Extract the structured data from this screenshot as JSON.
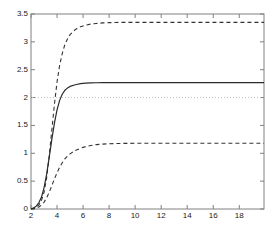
{
  "chart_data": {
    "type": "line",
    "title": "",
    "xlabel": "",
    "ylabel": "",
    "xlim": [
      2,
      19.9
    ],
    "ylim": [
      0,
      3.5
    ],
    "xticks": [
      2,
      4,
      6,
      8,
      10,
      12,
      14,
      16,
      18
    ],
    "xtick_labels": [
      "2",
      "4",
      "6",
      "8",
      "10",
      "12",
      "14",
      "16",
      "18"
    ],
    "yticks": [
      0,
      0.5,
      1,
      1.5,
      2,
      2.5,
      3,
      3.5
    ],
    "ytick_labels": [
      "0",
      "0.5",
      "1",
      "1.5",
      "2",
      "2.5",
      "3",
      "3.5"
    ],
    "grid": false,
    "legend": null,
    "background": "#ffffff",
    "axis_color": "#808080",
    "series": [
      {
        "name": "upper-confidence-bound",
        "style": "dashed",
        "color": "#333333",
        "asymptote": 3.35,
        "x": [
          2.0,
          2.2,
          2.4,
          2.6,
          2.8,
          3.0,
          3.2,
          3.4,
          3.6,
          3.8,
          4.0,
          4.2,
          4.4,
          4.6,
          4.8,
          5.0,
          5.4,
          5.8,
          6.2,
          6.6,
          7.0,
          7.5,
          8.0,
          8.5,
          9.0,
          9.5,
          10.0,
          11.0,
          12.0,
          13.0,
          14.0,
          15.0,
          16.0,
          17.0,
          18.0,
          19.0,
          19.9
        ],
        "values": [
          0.0,
          0.01,
          0.03,
          0.07,
          0.15,
          0.3,
          0.56,
          0.95,
          1.42,
          1.88,
          2.28,
          2.58,
          2.79,
          2.95,
          3.05,
          3.13,
          3.22,
          3.27,
          3.3,
          3.32,
          3.33,
          3.34,
          3.345,
          3.348,
          3.35,
          3.35,
          3.35,
          3.35,
          3.35,
          3.35,
          3.35,
          3.35,
          3.35,
          3.35,
          3.35,
          3.35,
          3.35
        ]
      },
      {
        "name": "mean-estimate",
        "style": "solid",
        "color": "#2b2b2b",
        "asymptote": 2.27,
        "x": [
          2.0,
          2.2,
          2.4,
          2.6,
          2.8,
          3.0,
          3.2,
          3.4,
          3.6,
          3.8,
          4.0,
          4.2,
          4.4,
          4.6,
          4.8,
          5.0,
          5.4,
          5.8,
          6.2,
          6.6,
          7.0,
          7.5,
          8.0,
          8.5,
          9.0,
          9.5,
          10.0,
          11.0,
          12.0,
          13.0,
          14.0,
          15.0,
          16.0,
          17.0,
          18.0,
          19.0,
          19.9
        ],
        "values": [
          0.0,
          0.02,
          0.05,
          0.11,
          0.21,
          0.38,
          0.62,
          0.93,
          1.25,
          1.54,
          1.78,
          1.95,
          2.06,
          2.13,
          2.17,
          2.2,
          2.23,
          2.25,
          2.258,
          2.263,
          2.266,
          2.268,
          2.269,
          2.27,
          2.27,
          2.27,
          2.27,
          2.27,
          2.27,
          2.27,
          2.27,
          2.27,
          2.27,
          2.27,
          2.27,
          2.27,
          2.27
        ]
      },
      {
        "name": "lower-confidence-bound",
        "style": "dashed",
        "color": "#333333",
        "asymptote": 1.18,
        "x": [
          2.0,
          2.2,
          2.4,
          2.6,
          2.8,
          3.0,
          3.2,
          3.4,
          3.6,
          3.8,
          4.0,
          4.2,
          4.4,
          4.6,
          4.8,
          5.0,
          5.4,
          5.8,
          6.2,
          6.6,
          7.0,
          7.5,
          8.0,
          8.5,
          9.0,
          9.5,
          10.0,
          11.0,
          12.0,
          13.0,
          14.0,
          15.0,
          16.0,
          17.0,
          18.0,
          19.0,
          19.9
        ],
        "values": [
          0.0,
          0.005,
          0.015,
          0.035,
          0.07,
          0.12,
          0.2,
          0.3,
          0.42,
          0.54,
          0.65,
          0.75,
          0.83,
          0.9,
          0.95,
          0.99,
          1.05,
          1.09,
          1.12,
          1.14,
          1.155,
          1.165,
          1.172,
          1.175,
          1.177,
          1.178,
          1.179,
          1.18,
          1.18,
          1.18,
          1.18,
          1.18,
          1.18,
          1.18,
          1.18,
          1.18,
          1.18
        ]
      }
    ],
    "reference_lines": [
      {
        "name": "true-value-reference",
        "orientation": "horizontal",
        "value": 2.0,
        "style": "dotted",
        "color": "#bfbfbf"
      }
    ]
  }
}
